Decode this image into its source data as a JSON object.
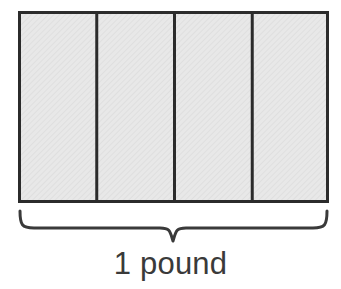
{
  "figure": {
    "kind": "fraction-bar-model",
    "brace_label": "1 pound",
    "colors": {
      "background": "#ffffff",
      "cell_fill": "#e7e7e7",
      "cell_fill_texture": "#dedede",
      "outline": "#2b2b2b",
      "divider": "#2b2b2b",
      "brace": "#3a3a3a",
      "label_text": "#3a3a3a"
    },
    "rectangle": {
      "x": 18,
      "y": 11,
      "width": 311,
      "height": 192,
      "stroke_width": 3,
      "parts": 4,
      "part_labels": [
        "",
        "",
        "",
        ""
      ],
      "divider_x_positions": [
        96.75,
        174.5,
        252.25
      ],
      "divider_stroke_width": 3
    },
    "brace": {
      "orientation": "down",
      "left_x": 19,
      "right_x": 328,
      "top_y": 211,
      "line_y": 228,
      "tip_x": 173,
      "tip_y": 241,
      "stroke_width": 3
    }
  }
}
